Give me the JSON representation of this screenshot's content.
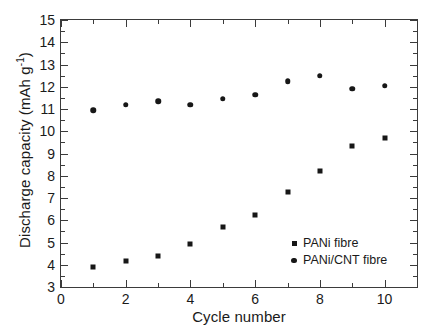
{
  "chart_data": {
    "type": "scatter",
    "title": "",
    "xlabel": "Cycle number",
    "ylabel_text": "Discharge capacity (mAh g",
    "ylabel_sup": "-1",
    "ylabel_tail": ")",
    "ylabel_full": "Discharge capacity (mAh g-1)",
    "x": [
      1,
      2,
      3,
      4,
      5,
      6,
      7,
      8,
      9,
      10
    ],
    "series": [
      {
        "name": "PANi fibre",
        "marker": "square",
        "values": [
          3.9,
          4.15,
          4.4,
          4.95,
          5.7,
          6.25,
          7.25,
          8.2,
          9.35,
          9.7
        ]
      },
      {
        "name": "PANi/CNT fibre",
        "marker": "circle",
        "values": [
          10.95,
          11.2,
          11.35,
          11.2,
          11.45,
          11.65,
          12.25,
          12.5,
          11.9,
          12.05
        ]
      }
    ],
    "xlim": [
      0,
      11
    ],
    "ylim": [
      3,
      15
    ],
    "xticks_major": [
      0,
      2,
      4,
      6,
      8,
      10
    ],
    "xticks_minor": [
      1,
      3,
      5,
      7,
      9,
      11
    ],
    "xtick_labels": [
      "0",
      "2",
      "4",
      "6",
      "8",
      "10"
    ],
    "yticks_major": [
      3,
      4,
      5,
      6,
      7,
      8,
      9,
      10,
      11,
      12,
      13,
      14,
      15
    ],
    "yticks_minor": [
      3.5,
      4.5,
      5.5,
      6.5,
      7.5,
      8.5,
      9.5,
      10.5,
      11.5,
      12.5,
      13.5,
      14.5
    ],
    "ytick_labels": [
      "3",
      "4",
      "5",
      "6",
      "7",
      "8",
      "9",
      "10",
      "11",
      "12",
      "13",
      "14",
      "15"
    ],
    "grid": false,
    "legend_position": "lower-right-inside",
    "marker_color": "#171717",
    "axis_color": "#3b3b3b",
    "background": "#ffffff"
  }
}
